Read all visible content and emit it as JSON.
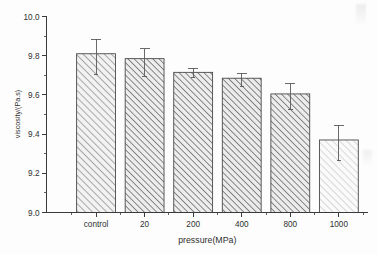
{
  "chart_data": {
    "type": "bar",
    "title": "",
    "subtitle": "",
    "xlabel": "pressure(MPa)",
    "ylabel": "viscosity/(Pa.s)",
    "categories": [
      "control",
      "20",
      "200",
      "400",
      "800",
      "1000"
    ],
    "values": [
      9.81,
      9.785,
      9.715,
      9.685,
      9.605,
      9.37
    ],
    "errors_upper": [
      0.075,
      0.05,
      0.022,
      0.025,
      0.055,
      0.075
    ],
    "errors_lower": [
      0.105,
      0.09,
      0.028,
      0.043,
      0.08,
      0.105
    ],
    "ylim": [
      9.0,
      10.0
    ],
    "xlim": [
      0,
      6.6
    ],
    "y_ticks": [
      "10.0",
      "9.8",
      "9.6",
      "9.4",
      "9.2",
      "9.0"
    ],
    "y_tick_values": [
      10.0,
      9.8,
      9.6,
      9.4,
      9.2,
      9.0
    ],
    "y_minor_count": 1,
    "grid": false,
    "legend": null,
    "legend_position": "none",
    "bar_fill_pattern": "diagonal-hatch",
    "bar_colors": [
      "#f2f2f2",
      "#ededed",
      "#ededed",
      "#ebebeb",
      "#ececec",
      "#fafafa"
    ],
    "hatch_colors": [
      "#8e8e8e",
      "#6e6e6e",
      "#6e6e6e",
      "#6b6b6b",
      "#6f6f6f",
      "#c6c6c6"
    ],
    "edge_color": "#4a4a4a",
    "error_bar_color": "#5a5a5a",
    "axis_color": "#3a3a3a",
    "background_color": "#fdfdfd"
  },
  "axes": {
    "y_axis_name": "viscosity-axis",
    "x_axis_name": "pressure-axis"
  }
}
